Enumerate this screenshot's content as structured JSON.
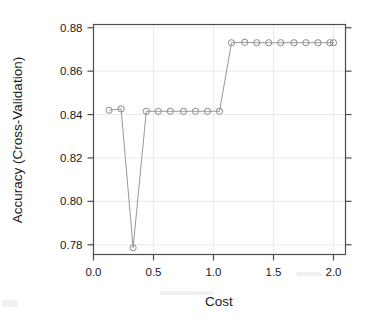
{
  "chart_data": {
    "type": "line",
    "title": "",
    "xlabel": "Cost",
    "ylabel": "Accuracy (Cross-Validation)",
    "xlim": [
      0.0,
      2.1
    ],
    "ylim": [
      0.7755,
      0.8815
    ],
    "grid": true,
    "legend": null,
    "marker": "open-circle",
    "xticks": [
      "0.0",
      "0.5",
      "1.0",
      "1.5",
      "2.0"
    ],
    "xtick_values": [
      0.0,
      0.5,
      1.0,
      1.5,
      2.0
    ],
    "yticks": [
      "0.78",
      "0.80",
      "0.82",
      "0.84",
      "0.86",
      "0.88"
    ],
    "ytick_values": [
      0.78,
      0.8,
      0.82,
      0.84,
      0.86,
      0.88
    ],
    "series": [
      {
        "name": "Accuracy (Cross-Validation)",
        "x": [
          0.13,
          0.23,
          0.33,
          0.44,
          0.54,
          0.64,
          0.75,
          0.85,
          0.95,
          1.05,
          1.15,
          1.26,
          1.36,
          1.46,
          1.56,
          1.67,
          1.77,
          1.87,
          1.97,
          2.0
        ],
        "y": [
          0.842,
          0.8426,
          0.7786,
          0.8415,
          0.8415,
          0.8415,
          0.8415,
          0.8415,
          0.8415,
          0.8415,
          0.8731,
          0.8733,
          0.8731,
          0.8731,
          0.8731,
          0.8731,
          0.8731,
          0.8731,
          0.8731,
          0.8731
        ]
      }
    ]
  },
  "axes": {
    "x_axis_label": "Cost",
    "y_axis_label": "Accuracy (Cross-Validation)"
  }
}
